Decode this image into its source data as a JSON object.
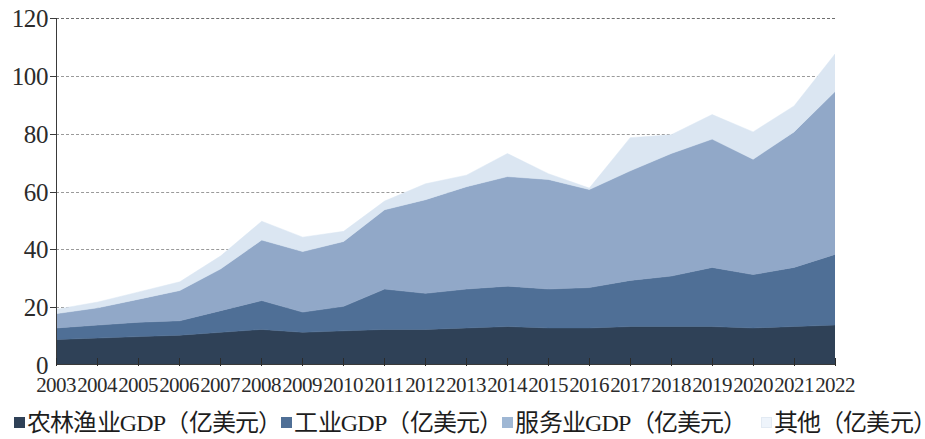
{
  "chart_data": {
    "type": "area",
    "stacked": true,
    "title": "",
    "subtitle": "",
    "xlabel": "",
    "ylabel": "",
    "ylim": [
      0,
      120
    ],
    "y_ticks": [
      0,
      20,
      40,
      60,
      80,
      100,
      120
    ],
    "grid": true,
    "legend_position": "bottom",
    "categories": [
      "2003",
      "2004",
      "2005",
      "2006",
      "2007",
      "2008",
      "2009",
      "2010",
      "2011",
      "2012",
      "2013",
      "2014",
      "2015",
      "2016",
      "2017",
      "2018",
      "2019",
      "2020",
      "2021",
      "2022"
    ],
    "series": [
      {
        "name": "农林渔业GDP（亿美元）",
        "color": "#2f4157",
        "values": [
          8.5,
          9.0,
          9.5,
          10.0,
          11.0,
          12.0,
          11.0,
          11.5,
          12.0,
          12.0,
          12.5,
          13.0,
          12.5,
          12.5,
          13.0,
          13.0,
          13.0,
          12.5,
          13.0,
          13.5
        ]
      },
      {
        "name": "工业GDP（亿美元）",
        "color": "#4f6f96",
        "values": [
          4.0,
          4.5,
          5.0,
          5.0,
          7.5,
          10.0,
          7.0,
          8.5,
          14.0,
          12.5,
          13.5,
          14.0,
          13.5,
          14.0,
          16.0,
          17.5,
          20.5,
          18.5,
          20.5,
          24.5
        ]
      },
      {
        "name": "服务业GDP（亿美元）",
        "color": "#91a8c8",
        "values": [
          5.0,
          6.0,
          8.0,
          10.5,
          14.5,
          21.0,
          21.0,
          22.5,
          27.5,
          32.5,
          35.5,
          38.0,
          38.0,
          34.0,
          38.0,
          42.5,
          44.5,
          40.0,
          47.0,
          56.5
        ]
      },
      {
        "name": "其他（亿美元）",
        "color": "#dbe6f2",
        "values": [
          1.5,
          2.0,
          2.5,
          3.0,
          4.5,
          6.5,
          5.0,
          3.5,
          3.0,
          5.5,
          4.0,
          8.0,
          2.0,
          0.5,
          11.5,
          6.5,
          8.5,
          9.5,
          9.0,
          13.0
        ]
      }
    ],
    "stack_totals": [
      19.0,
      21.5,
      25.0,
      28.5,
      37.5,
      49.5,
      44.0,
      46.0,
      56.5,
      62.5,
      65.5,
      73.0,
      66.0,
      61.0,
      78.5,
      79.5,
      86.5,
      80.5,
      89.5,
      107.5
    ]
  },
  "legend": {
    "items": [
      {
        "label": "农林渔业GDP（亿美元）",
        "color": "#2f4157",
        "swatch": "square-marker"
      },
      {
        "label": "工业GDP（亿美元）",
        "color": "#4f6f96",
        "swatch": "square-marker"
      },
      {
        "label": "服务业GDP（亿美元）",
        "color": "#9fb7d4",
        "swatch": "square-marker"
      },
      {
        "label": "其他（亿美元）",
        "color": "#eef4fb",
        "swatch": "square-marker"
      }
    ]
  },
  "axis": {
    "y_tick_labels": [
      "120",
      "100",
      "80",
      "60",
      "40",
      "20",
      "0"
    ]
  }
}
